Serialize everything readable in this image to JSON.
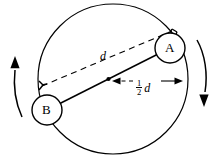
{
  "figure": {
    "type": "mechanics-diagram",
    "stroke_color": "#000000",
    "background_color": "#ffffff",
    "bodies": [
      {
        "id": "A",
        "label": "A",
        "cx": 170,
        "cy": 48,
        "r": 15
      },
      {
        "id": "B",
        "label": "B",
        "cx": 47,
        "cy": 110,
        "r": 15
      }
    ],
    "orbit_circle": {
      "cx": 113,
      "cy": 79,
      "r": 75
    },
    "separation_label": "d",
    "half_separation": {
      "numerator": "1",
      "denominator": "2",
      "symbol": "d"
    },
    "rotation_arrows": [
      {
        "name": "left-rotation-arrow",
        "direction": "up"
      },
      {
        "name": "right-rotation-arrow",
        "direction": "down"
      }
    ],
    "midpoint": {
      "x": 113.5,
      "y": 79.5
    }
  }
}
